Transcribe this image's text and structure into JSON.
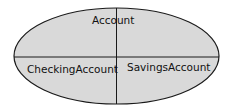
{
  "diagram": {
    "type": "partitioned-ellipse",
    "colors": {
      "fill": "#d9d9d9",
      "stroke": "#1a1a1a",
      "background": "#ffffff"
    },
    "labels": {
      "top": "Account",
      "bottom_left": "CheckingAccount",
      "bottom_right": "SavingsAccount"
    }
  }
}
